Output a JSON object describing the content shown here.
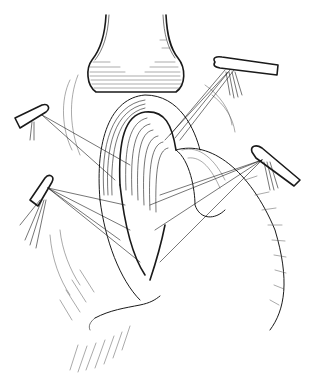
{
  "illustration": {
    "subject": "surgical line drawing",
    "description": "Black-and-white pen illustration of a tubular structure retracted with four stay-suture retractor holders, surrounded by hatched tissue",
    "colors": {
      "background": "#ffffff",
      "ink": "#1a1a1a"
    },
    "elements": [
      {
        "name": "upper-tubular-structure"
      },
      {
        "name": "central-mobilized-segment"
      },
      {
        "name": "retractor-upper-right"
      },
      {
        "name": "retractor-left"
      },
      {
        "name": "retractor-lower-left"
      },
      {
        "name": "retractor-right"
      },
      {
        "name": "curved-organ-right"
      },
      {
        "name": "lower-tissue-fold"
      }
    ]
  }
}
